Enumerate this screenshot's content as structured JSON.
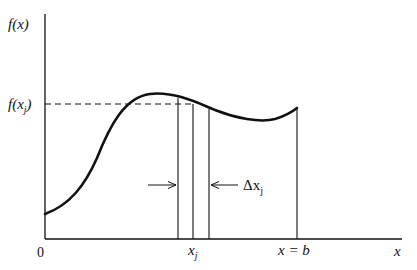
{
  "diagram": {
    "axes": {
      "y_label": "f(x)",
      "x_label": "x",
      "origin_label": "0"
    },
    "labels": {
      "f_xj": "f(x_j)",
      "xj": "x_j",
      "x_eq_b": "x = b",
      "delta_xj": "Δx_j"
    },
    "label_parts": {
      "f_xj_main": "f(x",
      "f_xj_sub": "j",
      "f_xj_close": ")",
      "xj_main": "x",
      "xj_sub": "j",
      "x_eq_b": "x = b",
      "delta_main": "Δx",
      "delta_sub": "j",
      "y_axis": "f(x)",
      "x_axis": "x",
      "origin": "0"
    },
    "colors": {
      "stroke": "#111111",
      "background": "#ffffff"
    }
  }
}
